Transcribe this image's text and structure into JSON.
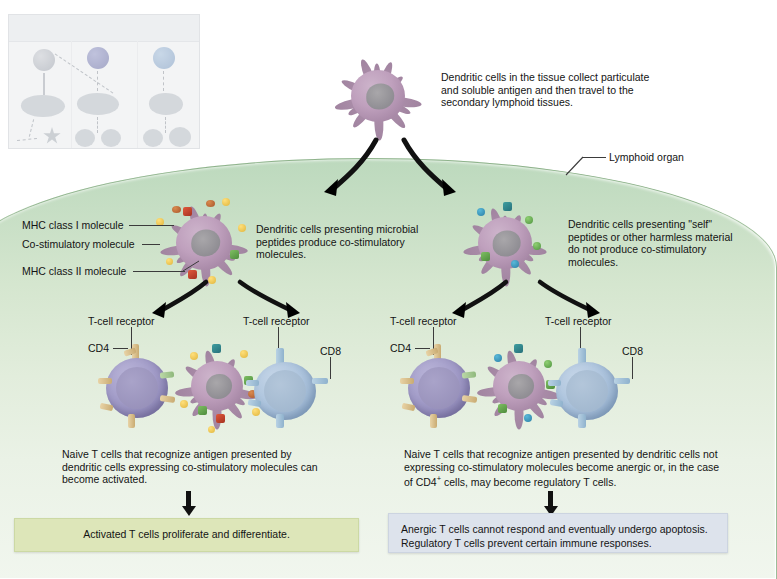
{
  "figure": {
    "organ_label": "Lymphoid organ",
    "colors": {
      "organ_fill": "#cfe3c9",
      "dendritic_cell": "#bfa0bd",
      "cd4_tcell": "#a29cc8",
      "cd8_tcell": "#adc4dd",
      "activated_box": "#dde6b9",
      "anergic_box": "#dde3ec",
      "mhc_class_i": "#c06a33",
      "co_stimulatory": "#e8c455",
      "mhc_class_ii": "#c4402a",
      "arrow": "#111111"
    }
  },
  "intro": {
    "text": "Dendritic cells in the tissue collect particulate and soluble antigen and then travel to the secondary lymphoid tissues."
  },
  "left_labels": {
    "mhc1": "MHC class I molecule",
    "costim": "Co-stimulatory molecule",
    "mhc2": "MHC class II molecule"
  },
  "branches": {
    "left": {
      "caption": "Dendritic cells presenting microbial peptides produce co-stimulatory molecules.",
      "tcr_left": "T-cell receptor",
      "tcr_right": "T-cell receptor",
      "cd4": "CD4",
      "cd8": "CD8",
      "summary": "Naive T cells that recognize antigen presented by dendritic cells expressing co-stimulatory molecules can become activated.",
      "outcome": "Activated T cells proliferate and differentiate."
    },
    "right": {
      "caption": "Dendritic cells presenting \"self\" peptides or other harmless material do not produce co-stimulatory molecules.",
      "tcr_left": "T-cell receptor",
      "tcr_right": "T-cell receptor",
      "cd4": "CD4",
      "cd8": "CD8",
      "summary_part1": "Naive T cells that recognize antigen presented by dendritic cells not expressing co-stimulatory molecules become anergic or, in the case of CD4",
      "summary_sup": "+",
      "summary_part2": " cells, may become regulatory T cells.",
      "outcome": "Anergic T cells cannot respond and eventually undergo apoptosis.\nRegulatory T cells prevent certain immune responses."
    }
  }
}
